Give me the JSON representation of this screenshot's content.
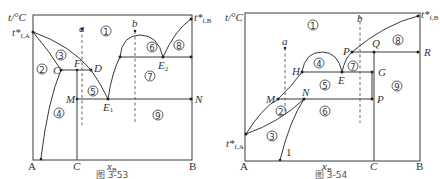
{
  "figures": [
    {
      "caption": "图 3-53",
      "y_axis_label": "t/°C",
      "x_axis_label": "x",
      "x_axis_sub": "B",
      "left_component": "A",
      "right_component": "B",
      "compound_label": "C",
      "melting_A": {
        "main": "t*",
        "sub": "f,A"
      },
      "melting_B": {
        "main": "t*",
        "sub": "f,B"
      },
      "points": {
        "C": "C",
        "F": "F",
        "D": "D",
        "M": "M",
        "N": "N",
        "E1": "E",
        "E1_sub": "1",
        "E2": "E",
        "E2_sub": "2"
      },
      "paths": {
        "a": "a",
        "b": "b"
      },
      "regions": [
        "1",
        "2",
        "3",
        "4",
        "5",
        "6",
        "7",
        "8",
        "9"
      ]
    },
    {
      "caption": "图 3-54",
      "y_axis_label": "t/°C",
      "x_axis_label": "x",
      "x_axis_sub": "B",
      "left_component": "A",
      "right_component": "B",
      "compound_label": "C",
      "melting_A": {
        "main": "t*",
        "sub": "f,A"
      },
      "melting_B": {
        "main": "t*",
        "sub": "f,B"
      },
      "points": {
        "M": "M",
        "N": "N",
        "P_low": "P",
        "H": "H",
        "E": "E",
        "G": "G",
        "P_high": "P",
        "Q": "Q",
        "R": "R",
        "one": "1"
      },
      "paths": {
        "a": "a",
        "b": "b"
      },
      "regions": [
        "1",
        "2",
        "3",
        "4",
        "5",
        "6",
        "7",
        "8",
        "9"
      ]
    }
  ],
  "region_glyphs": {
    "1": "①",
    "2": "②",
    "3": "③",
    "4": "④",
    "5": "⑤",
    "6": "⑥",
    "7": "⑦",
    "8": "⑧",
    "9": "⑨"
  }
}
